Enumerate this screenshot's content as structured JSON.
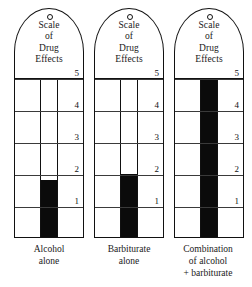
{
  "figure": {
    "title_lines": [
      "Scale",
      "of",
      "Drug",
      "Effects"
    ],
    "hole_icon": "ring-hole-icon",
    "scale_labels": [
      "5",
      "4",
      "3",
      "2",
      "1"
    ],
    "mercury_color": "#0b0b0b",
    "outline_color": "#111111",
    "background_color": "#ffffff"
  },
  "thermometers": [
    {
      "id": "alcohol-alone",
      "title_lines": [
        "Scale",
        "of",
        "Drug",
        "Effects"
      ],
      "caption_lines": [
        "Alcohol",
        "alone"
      ],
      "level_value": 1.8,
      "fill_percent": 36
    },
    {
      "id": "barbiturate-alone",
      "title_lines": [
        "Scale",
        "of",
        "Drug",
        "Effects"
      ],
      "caption_lines": [
        "Barbiturate",
        "alone"
      ],
      "level_value": 2.0,
      "fill_percent": 40
    },
    {
      "id": "combination-alcohol-barbiturate",
      "title_lines": [
        "Scale",
        "of",
        "Drug",
        "Effects"
      ],
      "caption_lines": [
        "Combination",
        "of alcohol",
        "+ barbiturate"
      ],
      "level_value": 5.0,
      "fill_percent": 100
    }
  ],
  "chart_data": {
    "type": "bar",
    "title": "Scale of Drug Effects",
    "categories": [
      "Alcohol alone",
      "Barbiturate alone",
      "Combination of alcohol + barbiturate"
    ],
    "values": [
      1.8,
      2.0,
      5.0
    ],
    "xlabel": "",
    "ylabel": "Scale of Drug Effects",
    "ylim": [
      0,
      5
    ],
    "tick_labels": [
      "1",
      "2",
      "3",
      "4",
      "5"
    ],
    "grid": true,
    "legend": "none"
  }
}
